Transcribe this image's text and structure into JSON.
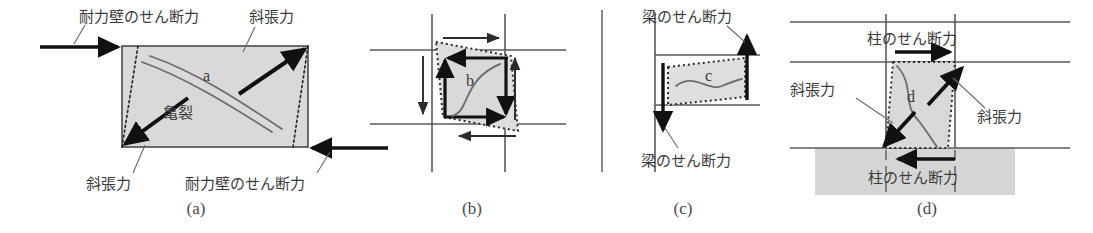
{
  "figure": {
    "type": "engineering-diagram",
    "colors": {
      "ink": "#3b3b3b",
      "line": "#555555",
      "fill_gray": "#d9d9d9",
      "band_gray": "#d5d5d5",
      "bold_arrow": "#111111",
      "dotted": "#2b2b2b"
    }
  },
  "panels": [
    {
      "id": "a",
      "caption": "(a)",
      "member_label": "a",
      "crack_label": "亀裂",
      "labels": {
        "top_shear": "耐力壁のせん断力",
        "bottom_shear": "耐力壁のせん断力",
        "top_tension": "斜張力",
        "bottom_tension": "斜張力"
      }
    },
    {
      "id": "b",
      "caption": "(b)",
      "member_label": "b",
      "labels": {}
    },
    {
      "id": "c",
      "caption": "(c)",
      "member_label": "c",
      "labels": {
        "top_shear": "梁のせん断力",
        "bottom_shear": "梁のせん断力"
      }
    },
    {
      "id": "d",
      "caption": "(d)",
      "member_label": "d",
      "labels": {
        "top_shear": "柱のせん断力",
        "bottom_shear": "柱のせん断力",
        "left_tension": "斜張力",
        "right_tension": "斜張力"
      }
    }
  ]
}
